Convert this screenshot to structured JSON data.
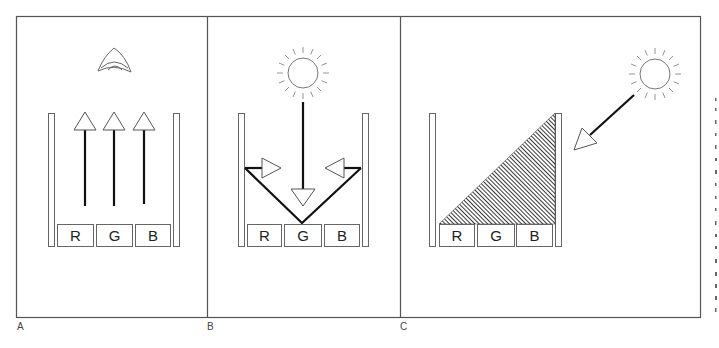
{
  "figure": {
    "panels": [
      {
        "id": "A",
        "label": "A",
        "source_icon": "eye-icon",
        "description": "Emissive display: each subpixel emits its own light upward toward the eye",
        "subpixels": [
          "R",
          "G",
          "B"
        ],
        "arrows": "three upward arrows from R, G, B subpixels"
      },
      {
        "id": "B",
        "label": "B",
        "source_icon": "sun-icon",
        "description": "Transflective/reflective: ambient light enters vertically, reflected sideways by a V-shaped reflector",
        "subpixels": [
          "R",
          "G",
          "B"
        ],
        "arrows": "downward arrow from sun; two inward horizontal arrows at reflector edges"
      },
      {
        "id": "C",
        "label": "C",
        "source_icon": "sun-icon",
        "description": "Ambient light enters at an angle; shaded (hatched) region covers subpixels",
        "subpixels": [
          "R",
          "G",
          "B"
        ],
        "arrows": "diagonal arrow from sun toward the well"
      }
    ],
    "colors": {
      "line": "#111111",
      "outline": "#666666",
      "hatch": "#333333",
      "background": "#ffffff"
    }
  }
}
